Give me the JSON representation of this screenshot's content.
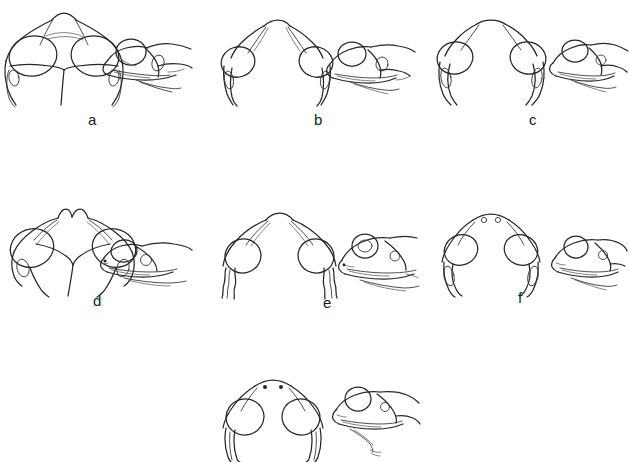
{
  "figure": {
    "type": "line-drawing-plate",
    "background_color": "#ffffff",
    "ink_color": "#262626",
    "width": 629,
    "height": 455,
    "views_per_panel": [
      "dorsal head view",
      "lateral head view"
    ],
    "panel_count": 7,
    "labeled_panel_count": 6
  },
  "panels": [
    {
      "id": "panel-a",
      "label": "a",
      "label_x": 88,
      "label_y": 112,
      "row": 1,
      "column": 1,
      "x": 0,
      "y": 8,
      "dorsal_view_name": "dorsal-head-a",
      "lateral_view_name": "lateral-head-a"
    },
    {
      "id": "panel-b",
      "label": "b",
      "label_x": 314,
      "label_y": 112,
      "row": 1,
      "column": 2,
      "x": 210,
      "y": 8,
      "dorsal_view_name": "dorsal-head-b",
      "lateral_view_name": "lateral-head-b"
    },
    {
      "id": "panel-c",
      "label": "c",
      "label_x": 529,
      "label_y": 112,
      "row": 1,
      "column": 3,
      "x": 425,
      "y": 8,
      "dorsal_view_name": "dorsal-head-c",
      "lateral_view_name": "lateral-head-c"
    },
    {
      "id": "panel-d",
      "label": "d",
      "label_x": 93,
      "label_y": 298,
      "row": 2,
      "column": 1,
      "x": 0,
      "y": 198,
      "dorsal_view_name": "dorsal-head-d",
      "lateral_view_name": "lateral-head-d"
    },
    {
      "id": "panel-e",
      "label": "e",
      "label_x": 323,
      "label_y": 300,
      "row": 2,
      "column": 2,
      "x": 210,
      "y": 198,
      "dorsal_view_name": "dorsal-head-e",
      "lateral_view_name": "lateral-head-e"
    },
    {
      "id": "panel-f",
      "label": "f",
      "label_x": 518,
      "label_y": 296,
      "row": 2,
      "column": 3,
      "x": 425,
      "y": 198,
      "dorsal_view_name": "dorsal-head-f",
      "lateral_view_name": "lateral-head-f"
    },
    {
      "id": "panel-g",
      "label": "",
      "label_x": 313,
      "label_y": 452,
      "row": 3,
      "column": 2,
      "x": 210,
      "y": 372,
      "dorsal_view_name": "dorsal-head-g",
      "lateral_view_name": "lateral-head-g"
    }
  ]
}
